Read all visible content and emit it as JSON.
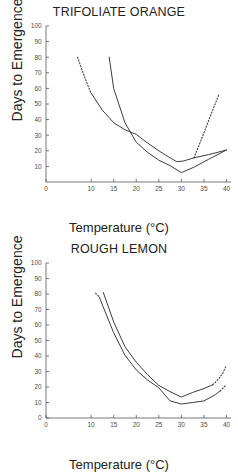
{
  "figure": {
    "panels": [
      {
        "id": "trifoliate-orange",
        "title": "TRIFOLIATE ORANGE",
        "xlabel": "Temperature (°C)",
        "ylabel": "Days to Emergence"
      },
      {
        "id": "rough-lemon",
        "title": "ROUGH LEMON",
        "xlabel": "Temperature (°C)",
        "ylabel": "Days to Emergence"
      }
    ]
  },
  "chart_data": [
    {
      "type": "line",
      "title": "TRIFOLIATE ORANGE",
      "xlabel": "Temperature (°C)",
      "ylabel": "Days to Emergence",
      "xlim": [
        0,
        41
      ],
      "ylim": [
        0,
        100
      ],
      "xticks": [
        0,
        10,
        15,
        20,
        25,
        30,
        35,
        40
      ],
      "xtick_labels": [
        "0",
        "10",
        "15",
        "20",
        "25",
        "30",
        "35",
        "40"
      ],
      "yticks": [
        10,
        20,
        30,
        40,
        50,
        60,
        70,
        80,
        90,
        100
      ],
      "ytick_labels": [
        "10",
        "20",
        "30",
        "40",
        "50",
        "60",
        "70",
        "80",
        "90",
        "100"
      ],
      "grid": false,
      "legend": null,
      "series": [
        {
          "name": "upper-curve",
          "style": "solid",
          "x": [
            10.0,
            12.5,
            15.0,
            17.5,
            20.0,
            22.5,
            25.0,
            27.5,
            29.0,
            30.5,
            32.8,
            36.0,
            40.0
          ],
          "y": [
            57.0,
            46.0,
            38.0,
            33.5,
            30.5,
            25.0,
            20.0,
            15.5,
            13.0,
            13.5,
            15.5,
            17.5,
            20.5
          ]
        },
        {
          "name": "upper-curve-extension-left",
          "style": "dotted",
          "x": [
            7.0,
            8.2,
            9.4,
            10.0
          ],
          "y": [
            80.0,
            70.0,
            61.0,
            57.0
          ]
        },
        {
          "name": "upper-curve-extension-right",
          "style": "dotted",
          "x": [
            32.8,
            34.6,
            36.4,
            38.3
          ],
          "y": [
            15.5,
            28.5,
            42.0,
            56.0
          ]
        },
        {
          "name": "lower-curve",
          "style": "solid",
          "x": [
            14.0,
            15.0,
            17.5,
            20.0,
            22.5,
            25.0,
            27.5,
            30.0,
            32.8,
            36.0,
            40.0
          ],
          "y": [
            80.0,
            60.0,
            38.0,
            25.5,
            19.0,
            14.0,
            10.5,
            6.0,
            9.5,
            14.5,
            20.5
          ]
        }
      ]
    },
    {
      "type": "line",
      "title": "ROUGH LEMON",
      "xlabel": "Temperature (°C)",
      "ylabel": "Days to Emergence",
      "xlim": [
        0,
        41
      ],
      "ylim": [
        0,
        100
      ],
      "xticks": [
        0,
        10,
        15,
        20,
        25,
        30,
        35,
        40
      ],
      "xtick_labels": [
        "0",
        "10",
        "15",
        "20",
        "25",
        "30",
        "35",
        "40"
      ],
      "yticks": [
        0,
        10,
        20,
        30,
        40,
        50,
        60,
        70,
        80,
        90,
        100
      ],
      "ytick_labels": [
        "0",
        "10",
        "20",
        "30",
        "40",
        "50",
        "60",
        "70",
        "80",
        "90",
        "100"
      ],
      "grid": false,
      "legend": null,
      "series": [
        {
          "name": "upper-curve",
          "style": "solid",
          "x": [
            12.7,
            15.0,
            17.5,
            20.0,
            22.5,
            25.0,
            27.5,
            30.0,
            32.5,
            35.0,
            37.0
          ],
          "y": [
            81.0,
            62.0,
            46.0,
            36.0,
            28.0,
            21.0,
            17.0,
            13.5,
            16.5,
            19.0,
            21.5
          ]
        },
        {
          "name": "upper-curve-extension-right",
          "style": "dotted",
          "x": [
            37.0,
            38.2,
            39.2,
            39.9
          ],
          "y": [
            21.5,
            25.0,
            29.0,
            33.5
          ]
        },
        {
          "name": "lower-curve",
          "style": "solid",
          "x": [
            11.8,
            15.0,
            17.5,
            20.0,
            22.5,
            25.0,
            27.5,
            30.0,
            32.5,
            35.0,
            37.5,
            38.6
          ],
          "y": [
            78.0,
            55.0,
            40.5,
            31.0,
            24.5,
            19.5,
            11.0,
            9.0,
            10.0,
            11.0,
            15.0,
            17.5
          ]
        },
        {
          "name": "lower-curve-extension-left",
          "style": "dotted",
          "x": [
            11.0,
            11.5,
            11.8
          ],
          "y": [
            80.5,
            79.0,
            78.0
          ]
        },
        {
          "name": "lower-curve-extension-right",
          "style": "dotted",
          "x": [
            38.6,
            39.3,
            39.9
          ],
          "y": [
            17.5,
            19.5,
            21.5
          ]
        }
      ]
    }
  ]
}
